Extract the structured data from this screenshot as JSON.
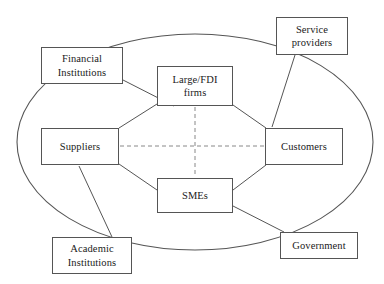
{
  "diagram": {
    "type": "node-link-ellipse",
    "background_color": "#ffffff",
    "line_color": "#555555",
    "text_color": "#1a1a1a",
    "boundary": {
      "shape": "ellipse",
      "name": "cluster-boundary-ellipse",
      "cx": 195,
      "cy": 142,
      "rx": 178,
      "ry": 108
    },
    "core_nodes": [
      {
        "id": "large-fdi-firms",
        "label": "Large/FDI\nfirms",
        "x": 157,
        "y": 66,
        "w": 76,
        "h": 40
      },
      {
        "id": "suppliers",
        "label": "Suppliers",
        "x": 41,
        "y": 128,
        "w": 78,
        "h": 37
      },
      {
        "id": "customers",
        "label": "Customers",
        "x": 265,
        "y": 128,
        "w": 78,
        "h": 37
      },
      {
        "id": "smes",
        "label": "SMEs",
        "x": 157,
        "y": 178,
        "w": 76,
        "h": 35
      }
    ],
    "external_nodes": [
      {
        "id": "financial-institutions",
        "label": "Financial\nInstitutions",
        "x": 41,
        "y": 47,
        "w": 82,
        "h": 37
      },
      {
        "id": "service-providers",
        "label": "Service\nproviders",
        "x": 276,
        "y": 17,
        "w": 72,
        "h": 38
      },
      {
        "id": "academic-institutions",
        "label": "Academic\nInstitutions",
        "x": 52,
        "y": 237,
        "w": 80,
        "h": 37
      },
      {
        "id": "government",
        "label": "Government",
        "x": 280,
        "y": 232,
        "w": 78,
        "h": 27
      }
    ],
    "solid_links": [
      {
        "from": "suppliers",
        "to": "large-fdi-firms",
        "x1": 119,
        "y1": 128,
        "x2": 157,
        "y2": 104
      },
      {
        "from": "large-fdi-firms",
        "to": "customers",
        "x1": 233,
        "y1": 105,
        "x2": 266,
        "y2": 128
      },
      {
        "from": "suppliers",
        "to": "smes",
        "x1": 119,
        "y1": 164,
        "x2": 157,
        "y2": 190
      },
      {
        "from": "smes",
        "to": "customers",
        "x1": 233,
        "y1": 190,
        "x2": 266,
        "y2": 165
      },
      {
        "from": "financial-institutions",
        "to": "large-fdi-firms",
        "x1": 123,
        "y1": 80,
        "x2": 174,
        "y2": 106
      },
      {
        "from": "service-providers",
        "to": "customers",
        "x1": 295,
        "y1": 55,
        "x2": 272,
        "y2": 127
      },
      {
        "from": "academic-institutions",
        "to": "suppliers",
        "x1": 112,
        "y1": 237,
        "x2": 79,
        "y2": 166
      },
      {
        "from": "government",
        "to": "smes",
        "x1": 284,
        "y1": 232,
        "x2": 233,
        "y2": 206
      }
    ],
    "dashed_links": [
      {
        "from": "large-fdi-firms",
        "to": "smes",
        "x1": 195,
        "y1": 107,
        "x2": 195,
        "y2": 177
      },
      {
        "from": "suppliers",
        "to": "customers",
        "x1": 120,
        "y1": 146,
        "x2": 264,
        "y2": 146
      }
    ]
  }
}
